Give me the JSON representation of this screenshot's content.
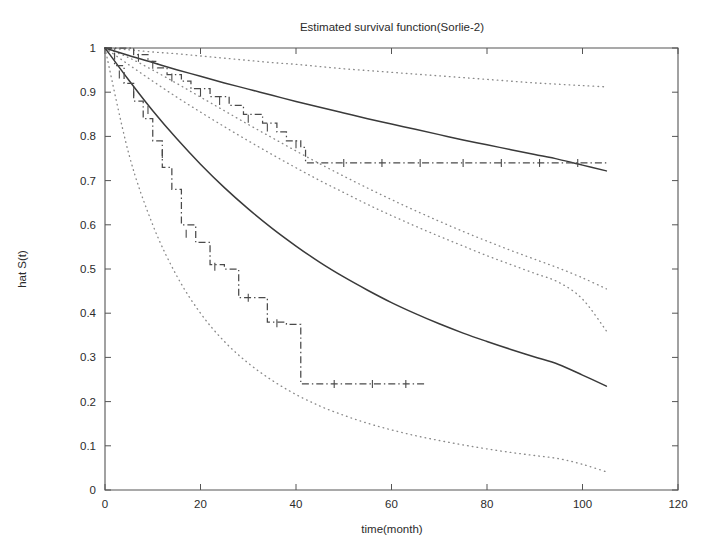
{
  "figure": {
    "background": "#ffffff",
    "axis_color": "#555555",
    "curve_color": "#3a3a3a",
    "band_color": "#8a8a8a",
    "step_color": "#4a4a4a"
  },
  "chart_data": {
    "type": "line",
    "title": "Estimated survival function(Sorlie-2)",
    "xlabel": "time(month)",
    "ylabel": "hat S(t)",
    "xlim": [
      0,
      120
    ],
    "ylim": [
      0,
      1
    ],
    "xticks": [
      0,
      20,
      40,
      60,
      80,
      100,
      120
    ],
    "xtick_labels": [
      "0",
      "20",
      "40",
      "60",
      "80",
      "100",
      "120"
    ],
    "yticks": [
      0,
      0.1,
      0.2,
      0.3,
      0.4,
      0.5,
      0.6,
      0.7,
      0.8,
      0.9,
      1
    ],
    "ytick_labels": [
      "0",
      "0.1",
      "0.2",
      "0.3",
      "0.4",
      "0.5",
      "0.6",
      "0.7",
      "0.8",
      "0.9",
      "1"
    ],
    "grid": false,
    "legend": null,
    "series": [
      {
        "name": "fitted-survival-group-1",
        "style": "solid",
        "x": [
          0,
          5,
          10,
          15,
          20,
          25,
          30,
          35,
          40,
          45,
          50,
          55,
          60,
          65,
          70,
          75,
          80,
          85,
          90,
          95,
          100,
          105
        ],
        "y": [
          1.0,
          0.983,
          0.967,
          0.951,
          0.936,
          0.921,
          0.907,
          0.893,
          0.879,
          0.866,
          0.853,
          0.84,
          0.828,
          0.816,
          0.804,
          0.792,
          0.781,
          0.77,
          0.759,
          0.748,
          0.735,
          0.722
        ]
      },
      {
        "name": "fitted-survival-group-2",
        "style": "solid",
        "x": [
          0,
          5,
          10,
          15,
          20,
          25,
          30,
          35,
          40,
          45,
          50,
          55,
          60,
          65,
          70,
          75,
          80,
          85,
          90,
          95,
          100,
          105
        ],
        "y": [
          1.0,
          0.927,
          0.858,
          0.795,
          0.737,
          0.684,
          0.636,
          0.592,
          0.552,
          0.515,
          0.482,
          0.452,
          0.424,
          0.399,
          0.376,
          0.355,
          0.336,
          0.318,
          0.301,
          0.284,
          0.26,
          0.235
        ]
      },
      {
        "name": "confidence-band-group-1-upper",
        "style": "dotted",
        "x": [
          0,
          5,
          10,
          15,
          20,
          25,
          30,
          35,
          40,
          45,
          50,
          55,
          60,
          65,
          70,
          75,
          80,
          85,
          90,
          95,
          100,
          105
        ],
        "y": [
          1.0,
          0.996,
          0.991,
          0.987,
          0.982,
          0.977,
          0.972,
          0.967,
          0.963,
          0.958,
          0.953,
          0.949,
          0.945,
          0.941,
          0.937,
          0.933,
          0.929,
          0.925,
          0.921,
          0.918,
          0.915,
          0.912
        ]
      },
      {
        "name": "confidence-band-group-1-lower",
        "style": "dotted",
        "x": [
          0,
          5,
          10,
          15,
          20,
          25,
          30,
          35,
          40,
          45,
          50,
          55,
          60,
          65,
          70,
          75,
          80,
          85,
          90,
          95,
          100,
          105
        ],
        "y": [
          1.0,
          0.962,
          0.925,
          0.889,
          0.855,
          0.822,
          0.79,
          0.759,
          0.729,
          0.7,
          0.673,
          0.646,
          0.621,
          0.597,
          0.574,
          0.552,
          0.53,
          0.51,
          0.49,
          0.47,
          0.432,
          0.36
        ]
      },
      {
        "name": "confidence-band-group-2-upper",
        "style": "dotted",
        "x": [
          0,
          5,
          10,
          15,
          20,
          25,
          30,
          35,
          40,
          45,
          50,
          55,
          60,
          65,
          70,
          75,
          80,
          85,
          90,
          95,
          100,
          105
        ],
        "y": [
          1.0,
          0.978,
          0.95,
          0.92,
          0.889,
          0.858,
          0.827,
          0.797,
          0.767,
          0.738,
          0.71,
          0.683,
          0.657,
          0.632,
          0.608,
          0.585,
          0.563,
          0.542,
          0.522,
          0.502,
          0.48,
          0.455
        ]
      },
      {
        "name": "confidence-band-group-2-lower",
        "style": "dotted",
        "x": [
          0,
          5,
          10,
          15,
          20,
          25,
          30,
          35,
          40,
          45,
          50,
          55,
          60,
          65,
          70,
          75,
          80,
          85,
          90,
          95,
          100,
          105
        ],
        "y": [
          1.0,
          0.76,
          0.6,
          0.485,
          0.4,
          0.336,
          0.287,
          0.248,
          0.216,
          0.19,
          0.169,
          0.151,
          0.136,
          0.123,
          0.112,
          0.102,
          0.093,
          0.085,
          0.078,
          0.071,
          0.058,
          0.041
        ]
      },
      {
        "name": "kaplan-meier-group-1",
        "style": "dashdot-step",
        "x": [
          0,
          6,
          9,
          11,
          13,
          16,
          18,
          22,
          26,
          29,
          33,
          36,
          38,
          41,
          42,
          105
        ],
        "y": [
          1.0,
          0.985,
          0.97,
          0.955,
          0.94,
          0.925,
          0.908,
          0.89,
          0.87,
          0.85,
          0.83,
          0.81,
          0.79,
          0.775,
          0.74,
          0.74
        ]
      },
      {
        "name": "kaplan-meier-group-2",
        "style": "dashdot-step",
        "x": [
          0,
          2,
          4,
          6,
          8,
          10,
          12,
          14,
          16,
          19,
          22,
          25,
          28,
          31,
          34,
          38,
          41,
          67
        ],
        "y": [
          1.0,
          0.96,
          0.92,
          0.88,
          0.84,
          0.79,
          0.73,
          0.68,
          0.6,
          0.56,
          0.51,
          0.5,
          0.435,
          0.435,
          0.38,
          0.375,
          0.24,
          0.24
        ]
      }
    ],
    "censor_marks_group_1": [
      {
        "x": 7,
        "y": 0.978
      },
      {
        "x": 10,
        "y": 0.962
      },
      {
        "x": 14,
        "y": 0.933
      },
      {
        "x": 20,
        "y": 0.899
      },
      {
        "x": 24,
        "y": 0.88
      },
      {
        "x": 30,
        "y": 0.84
      },
      {
        "x": 34,
        "y": 0.82
      },
      {
        "x": 40,
        "y": 0.782
      },
      {
        "x": 50,
        "y": 0.74
      },
      {
        "x": 58,
        "y": 0.74
      },
      {
        "x": 66,
        "y": 0.74
      },
      {
        "x": 75,
        "y": 0.74
      },
      {
        "x": 83,
        "y": 0.74
      },
      {
        "x": 91,
        "y": 0.74
      },
      {
        "x": 99,
        "y": 0.74
      }
    ],
    "censor_marks_group_2": [
      {
        "x": 3,
        "y": 0.94
      },
      {
        "x": 6,
        "y": 0.9
      },
      {
        "x": 9,
        "y": 0.86
      },
      {
        "x": 12,
        "y": 0.76
      },
      {
        "x": 17,
        "y": 0.58
      },
      {
        "x": 23,
        "y": 0.505
      },
      {
        "x": 30,
        "y": 0.435
      },
      {
        "x": 36,
        "y": 0.377
      },
      {
        "x": 48,
        "y": 0.24
      },
      {
        "x": 56,
        "y": 0.24
      },
      {
        "x": 63,
        "y": 0.24
      }
    ]
  }
}
